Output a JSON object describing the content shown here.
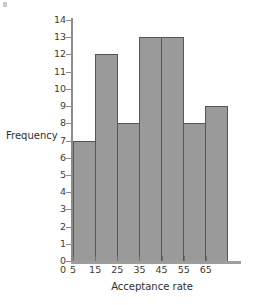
{
  "chart_data": {
    "type": "bar",
    "title": "",
    "subtitle": "",
    "xlabel": "Acceptance rate",
    "ylabel": "Frequency",
    "categories": [
      "5-15",
      "15-25",
      "25-35",
      "35-45",
      "45-55",
      "55-65",
      "65-75"
    ],
    "values": [
      7,
      12,
      8,
      13,
      13,
      8,
      9
    ],
    "bin_edges": [
      5,
      15,
      25,
      35,
      45,
      55,
      65,
      75
    ],
    "x_tick_labels": [
      "0",
      "5",
      "15",
      "25",
      "35",
      "45",
      "55",
      "65"
    ],
    "x_tick_values": [
      0,
      5,
      15,
      25,
      35,
      45,
      55,
      65
    ],
    "y_tick_labels": [
      "0",
      "1",
      "2",
      "3",
      "4",
      "5",
      "6",
      "7",
      "8",
      "9",
      "10",
      "11",
      "12",
      "13",
      "14"
    ],
    "y_tick_values": [
      0,
      1,
      2,
      3,
      4,
      5,
      6,
      7,
      8,
      9,
      10,
      11,
      12,
      13,
      14
    ],
    "ylim": [
      0,
      14
    ],
    "xlim": [
      5,
      75
    ],
    "grid": false,
    "legend": false,
    "bar_fill_color": "#9a9a9a",
    "bar_edge_color": "#555555",
    "axis_color": "#8c8c8c",
    "text_color": "#3b3b3b",
    "background_color": "#ffffff"
  }
}
